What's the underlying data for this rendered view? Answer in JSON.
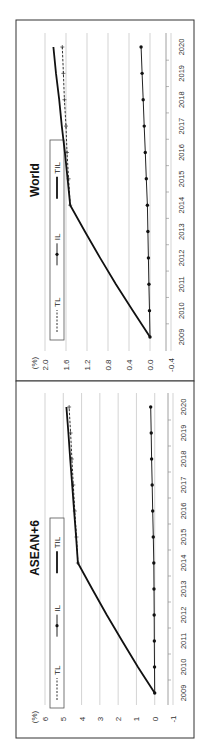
{
  "figure": {
    "orientation": "rotated-90-ccw",
    "unit_label": "(%)"
  },
  "chart_data": [
    {
      "type": "line",
      "title": "World",
      "xlabel": "",
      "ylabel": "(%)",
      "x": [
        "2009",
        "2010",
        "2011",
        "2012",
        "2013",
        "2014",
        "2015",
        "2016",
        "2017",
        "2018",
        "2019",
        "2020"
      ],
      "ylim": [
        -0.4,
        2.0
      ],
      "yticks": [
        "2.0",
        "1.6",
        "1.2",
        "0.8",
        "0.4",
        "0.0",
        "-0.4"
      ],
      "ytick_values": [
        2.0,
        1.6,
        1.2,
        0.8,
        0.4,
        0.0,
        -0.4
      ],
      "grid": true,
      "legend": [
        "TL",
        "IL",
        "TIL"
      ],
      "legend_position": "top-left inside",
      "series": [
        {
          "name": "TL",
          "style": "dashed-plus",
          "values": [
            null,
            null,
            null,
            null,
            null,
            1.52,
            1.55,
            1.58,
            1.6,
            1.63,
            1.65,
            1.67
          ]
        },
        {
          "name": "IL",
          "style": "solid-dot",
          "values": [
            0.0,
            0.01,
            0.02,
            0.03,
            0.04,
            0.05,
            0.07,
            0.09,
            0.11,
            0.13,
            0.15,
            0.17
          ]
        },
        {
          "name": "TIL",
          "style": "solid-thick",
          "values": [
            0.0,
            0.33,
            0.65,
            0.95,
            1.24,
            1.52,
            1.57,
            1.62,
            1.68,
            1.73,
            1.79,
            1.84
          ]
        }
      ]
    },
    {
      "type": "line",
      "title": "ASEAN+6",
      "xlabel": "",
      "ylabel": "(%)",
      "x": [
        "2009",
        "2010",
        "2011",
        "2012",
        "2013",
        "2014",
        "2015",
        "2016",
        "2017",
        "2018",
        "2019",
        "2020"
      ],
      "ylim": [
        -1,
        6
      ],
      "yticks": [
        "6",
        "5",
        "4",
        "3",
        "2",
        "1",
        "0",
        "-1"
      ],
      "ytick_values": [
        6,
        5,
        4,
        3,
        2,
        1,
        0,
        -1
      ],
      "grid": true,
      "legend": [
        "TL",
        "IL",
        "TIL"
      ],
      "legend_position": "top-left inside",
      "series": [
        {
          "name": "TL",
          "style": "dashed-plus",
          "values": [
            null,
            null,
            null,
            null,
            null,
            4.2,
            4.28,
            4.37,
            4.45,
            4.53,
            4.6,
            4.68
          ]
        },
        {
          "name": "IL",
          "style": "solid-dot",
          "values": [
            0.0,
            0.01,
            0.02,
            0.03,
            0.04,
            0.05,
            0.08,
            0.11,
            0.14,
            0.17,
            0.19,
            0.22
          ]
        },
        {
          "name": "TIL",
          "style": "solid-thick",
          "values": [
            0.0,
            0.92,
            1.78,
            2.62,
            3.42,
            4.2,
            4.3,
            4.41,
            4.51,
            4.62,
            4.72,
            4.83
          ]
        }
      ]
    }
  ]
}
